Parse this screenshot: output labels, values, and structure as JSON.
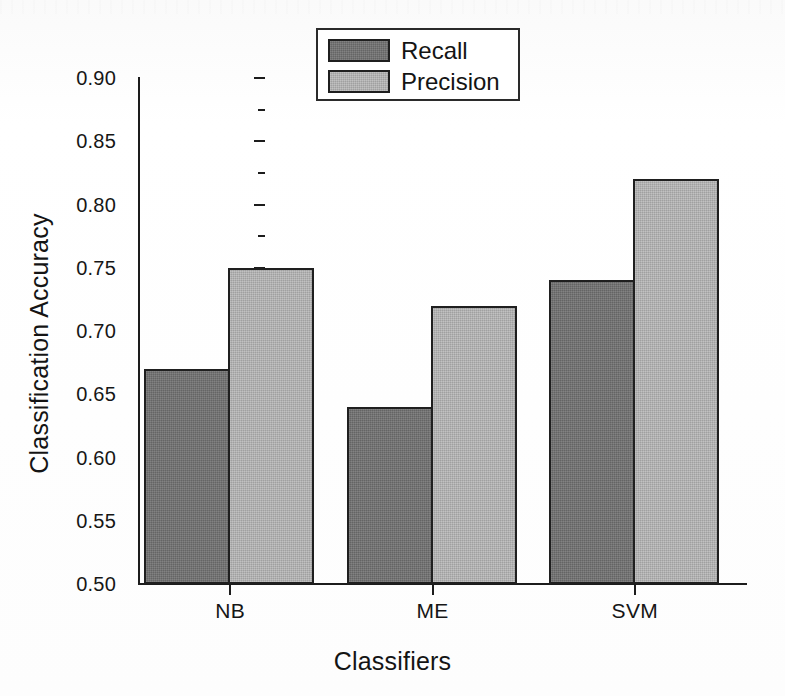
{
  "chart_data": {
    "type": "bar",
    "title": "",
    "xlabel": "Classifiers",
    "ylabel": "Classification Accuracy",
    "categories": [
      "NB",
      "ME",
      "SVM"
    ],
    "series": [
      {
        "name": "Recall",
        "values": [
          0.67,
          0.64,
          0.74
        ],
        "color": "#6f6f6f"
      },
      {
        "name": "Precision",
        "values": [
          0.75,
          0.72,
          0.82
        ],
        "color": "#b2b2b2"
      }
    ],
    "ylim": [
      0.5,
      0.9
    ],
    "ytick_labels": [
      "0.90",
      "0.85",
      "0.80",
      "0.75",
      "0.70",
      "0.65",
      "0.60",
      "0.55",
      "0.50"
    ],
    "ytick_values": [
      0.9,
      0.85,
      0.8,
      0.75,
      0.7,
      0.65,
      0.6,
      0.55,
      0.5
    ],
    "yminor_values": [
      0.875,
      0.825,
      0.775,
      0.725,
      0.675,
      0.625,
      0.575,
      0.525
    ],
    "grid": false,
    "legend_position": "top-center",
    "bar_style": "grouped-adjacent",
    "frame": "left-bottom-axes"
  },
  "legend": {
    "entries": [
      {
        "label": "Recall",
        "swatch": "dark-gray-swatch"
      },
      {
        "label": "Precision",
        "swatch": "light-gray-swatch"
      }
    ]
  }
}
